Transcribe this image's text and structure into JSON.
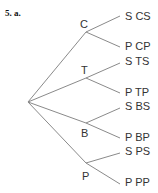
{
  "heading": "5. a.",
  "tree": {
    "root": {
      "x": 28,
      "y": 102
    },
    "first_level": [
      {
        "label": "C",
        "x": 86,
        "y": 32,
        "label_x": 80,
        "label_y": 19,
        "children": [
          {
            "label": "S",
            "outcome": "CS",
            "x": 120,
            "y": 16
          },
          {
            "label": "P",
            "outcome": "CP",
            "x": 120,
            "y": 47
          }
        ]
      },
      {
        "label": "T",
        "x": 86,
        "y": 78,
        "label_x": 81,
        "label_y": 65,
        "children": [
          {
            "label": "S",
            "outcome": "TS",
            "x": 120,
            "y": 63
          },
          {
            "label": "P",
            "outcome": "TP",
            "x": 120,
            "y": 93
          }
        ]
      },
      {
        "label": "B",
        "x": 86,
        "y": 123,
        "label_x": 81,
        "label_y": 128,
        "children": [
          {
            "label": "S",
            "outcome": "BS",
            "x": 120,
            "y": 108
          },
          {
            "label": "P",
            "outcome": "BP",
            "x": 120,
            "y": 138
          }
        ]
      },
      {
        "label": "P",
        "x": 86,
        "y": 163,
        "label_x": 82,
        "label_y": 171,
        "children": [
          {
            "label": "S",
            "outcome": "PS",
            "x": 120,
            "y": 153
          },
          {
            "label": "P",
            "outcome": "PP",
            "x": 120,
            "y": 184
          }
        ]
      }
    ]
  },
  "colors": {
    "line": "#8a8a8a",
    "text": "#333333"
  }
}
